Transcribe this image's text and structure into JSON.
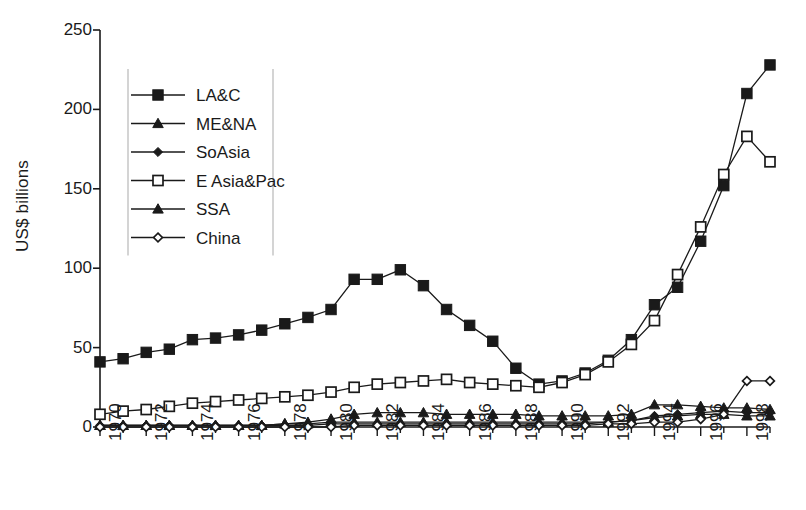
{
  "chart_data": {
    "type": "line",
    "title": "",
    "xlabel": "",
    "ylabel": "US$ billions",
    "xlim": [
      1970,
      1999
    ],
    "ylim": [
      0,
      250
    ],
    "ytick_values": [
      0,
      50,
      100,
      150,
      200,
      250
    ],
    "ytick_labels": [
      "0",
      "50",
      "100",
      "150",
      "200",
      "250"
    ],
    "xtick_labels": [
      "1970",
      "1972",
      "1974",
      "1976",
      "1978",
      "1980",
      "1982",
      "1984",
      "1986",
      "1988",
      "1990",
      "1992",
      "1994",
      "1996",
      "1998"
    ],
    "x": [
      1970,
      1971,
      1972,
      1973,
      1974,
      1975,
      1976,
      1977,
      1978,
      1979,
      1980,
      1981,
      1982,
      1983,
      1984,
      1985,
      1986,
      1987,
      1988,
      1989,
      1990,
      1991,
      1992,
      1993,
      1994,
      1995,
      1996,
      1997,
      1998,
      1999
    ],
    "grid": false,
    "legend_position": "upper-left",
    "series": [
      {
        "name": "LA&C",
        "marker": "filled-square",
        "color": "#1a1a1a",
        "values": [
          41,
          43,
          47,
          49,
          55,
          56,
          58,
          61,
          65,
          69,
          74,
          93,
          93,
          99,
          89,
          74,
          64,
          54,
          37,
          27,
          29,
          34,
          42,
          55,
          77,
          88,
          117,
          152,
          210,
          228
        ]
      },
      {
        "name": "ME&NA",
        "marker": "filled-triangle",
        "color": "#1a1a1a",
        "values": [
          1,
          1,
          1,
          1,
          1,
          1,
          1,
          1,
          2,
          3,
          5,
          8,
          9,
          9,
          9,
          8,
          8,
          8,
          8,
          7,
          7,
          7,
          7,
          8,
          14,
          14,
          13,
          12,
          12,
          11
        ]
      },
      {
        "name": "SoAsia",
        "marker": "filled-diamond",
        "color": "#1a1a1a",
        "values": [
          1,
          1,
          1,
          1,
          1,
          1,
          1,
          1,
          1,
          1,
          2,
          2,
          2,
          2,
          2,
          2,
          2,
          2,
          2,
          2,
          2,
          2,
          3,
          4,
          7,
          8,
          9,
          10,
          9,
          9
        ]
      },
      {
        "name": "E Asia&Pac",
        "marker": "open-square",
        "color": "#1a1a1a",
        "values": [
          8,
          10,
          11,
          13,
          15,
          16,
          17,
          18,
          19,
          20,
          22,
          25,
          27,
          28,
          29,
          30,
          28,
          27,
          26,
          25,
          28,
          33,
          41,
          52,
          67,
          96,
          126,
          159,
          183,
          167
        ]
      },
      {
        "name": "SSA",
        "marker": "filled-triangle",
        "color": "#1a1a1a",
        "values": [
          1,
          1,
          1,
          1,
          1,
          1,
          1,
          1,
          2,
          2,
          3,
          3,
          3,
          3,
          3,
          3,
          3,
          3,
          3,
          3,
          3,
          3,
          3,
          4,
          6,
          7,
          8,
          8,
          7,
          7
        ]
      },
      {
        "name": "China",
        "marker": "open-diamond",
        "color": "#1a1a1a",
        "values": [
          0,
          0,
          0,
          0,
          0,
          0,
          0,
          0,
          0,
          0,
          0,
          1,
          1,
          1,
          1,
          1,
          1,
          1,
          1,
          1,
          1,
          1,
          2,
          2,
          3,
          3,
          5,
          8,
          29,
          29
        ]
      }
    ]
  }
}
